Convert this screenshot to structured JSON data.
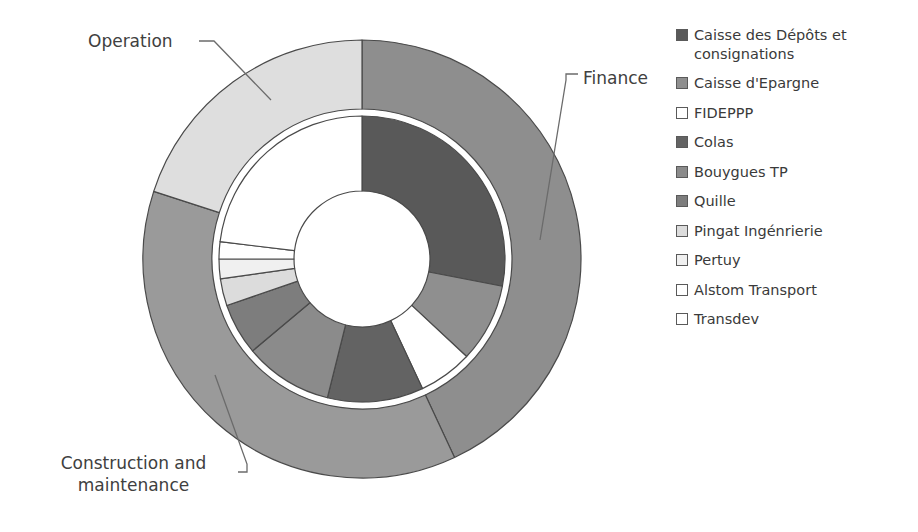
{
  "chart_data": {
    "type": "pie",
    "variant": "nested-donut",
    "title": "",
    "subtitle": "",
    "xlabel": "",
    "ylabel": "",
    "grid": false,
    "legend_position": "right",
    "center": {
      "cx": 362,
      "cy": 259
    },
    "radii": {
      "outer_ring_outer": 219,
      "outer_ring_inner": 150,
      "inner_ring_outer": 143,
      "inner_ring_inner": 68
    },
    "start_angle_deg": 0,
    "direction": "clockwise",
    "rings": [
      {
        "name": "outer",
        "label_source": "callouts",
        "categories": [
          "Finance",
          "Construction and maintenance",
          "Operation"
        ],
        "values": [
          43,
          37,
          20
        ],
        "colors": [
          "#8e8e8e",
          "#9a9a9a",
          "#dedede"
        ],
        "slices": [
          {
            "label": "Finance",
            "value": 43,
            "start_deg": 0,
            "end_deg": 155,
            "color": "#8e8e8e"
          },
          {
            "label": "Construction and maintenance",
            "value": 37,
            "start_deg": 155,
            "end_deg": 288,
            "color": "#9a9a9a"
          },
          {
            "label": "Operation",
            "value": 20,
            "start_deg": 288,
            "end_deg": 360,
            "color": "#dedede"
          }
        ]
      },
      {
        "name": "inner",
        "label_source": "legend",
        "categories": [
          "Caisse des Dépôts et consignations",
          "Caisse d'Epargne",
          "FIDEPPP",
          "Colas",
          "Bouygues TP",
          "Quille",
          "Pingat Ingénrierie",
          "Pertuy",
          "Alstom Transport",
          "Transdev"
        ],
        "values": [
          28,
          9,
          6,
          11,
          10,
          6,
          3,
          2,
          2,
          23
        ],
        "colors": [
          "#595959",
          "#8f8f8f",
          "#ffffff",
          "#636363",
          "#8b8b8b",
          "#7d7d7d",
          "#dcdcdc",
          "#f0f0f0",
          "#ffffff",
          "#ffffff"
        ],
        "slices": [
          {
            "label": "Caisse des Dépôts et consignations",
            "value": 28,
            "start_deg": 0,
            "end_deg": 101,
            "color": "#595959"
          },
          {
            "label": "Caisse d'Epargne",
            "value": 9,
            "start_deg": 101,
            "end_deg": 133,
            "color": "#8f8f8f"
          },
          {
            "label": "FIDEPPP",
            "value": 6,
            "start_deg": 133,
            "end_deg": 155,
            "color": "#ffffff"
          },
          {
            "label": "Colas",
            "value": 11,
            "start_deg": 155,
            "end_deg": 194,
            "color": "#636363"
          },
          {
            "label": "Bouygues TP",
            "value": 10,
            "start_deg": 194,
            "end_deg": 230,
            "color": "#8b8b8b"
          },
          {
            "label": "Quille",
            "value": 6,
            "start_deg": 230,
            "end_deg": 251,
            "color": "#7d7d7d"
          },
          {
            "label": "Pingat Ingénrierie",
            "value": 3,
            "start_deg": 251,
            "end_deg": 262,
            "color": "#dcdcdc"
          },
          {
            "label": "Pertuy",
            "value": 2,
            "start_deg": 262,
            "end_deg": 270,
            "color": "#f0f0f0"
          },
          {
            "label": "Alstom Transport",
            "value": 2,
            "start_deg": 270,
            "end_deg": 277,
            "color": "#ffffff"
          },
          {
            "label": "Transdev",
            "value": 23,
            "start_deg": 277,
            "end_deg": 360,
            "color": "#ffffff"
          }
        ]
      }
    ]
  },
  "callouts": {
    "operation": "Operation",
    "finance": "Finance",
    "construction_line1": "Construction and",
    "construction_line2": "maintenance"
  },
  "legend": {
    "items": [
      {
        "label": "Caisse des Dépôts et consignations",
        "color": "#595959"
      },
      {
        "label": "Caisse d'Epargne",
        "color": "#8f8f8f"
      },
      {
        "label": "FIDEPPP",
        "color": "#ffffff"
      },
      {
        "label": "Colas",
        "color": "#636363"
      },
      {
        "label": "Bouygues TP",
        "color": "#8b8b8b"
      },
      {
        "label": "Quille",
        "color": "#7d7d7d"
      },
      {
        "label": "Pingat Ingénrierie",
        "color": "#dcdcdc"
      },
      {
        "label": "Pertuy",
        "color": "#f0f0f0"
      },
      {
        "label": "Alstom Transport",
        "color": "#ffffff"
      },
      {
        "label": "Transdev",
        "color": "#ffffff"
      }
    ]
  },
  "style": {
    "stroke": "#4a4a4a",
    "text_color": "#3d3d3d",
    "background": "#ffffff"
  }
}
